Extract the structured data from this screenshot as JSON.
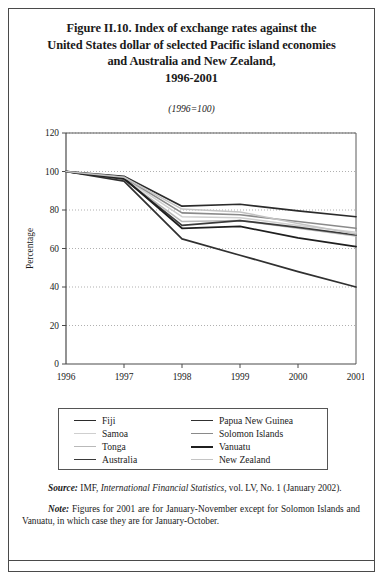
{
  "figure": {
    "title_lines": [
      "Figure II.10.   Index of exchange rates against the",
      "United States dollar of selected Pacific island economies",
      "and Australia and New Zealand,",
      "1996-2001"
    ],
    "subtitle": "(1996=100)"
  },
  "notes": {
    "source_label": "Source:",
    "source_text_1": "IMF,",
    "source_italic": "International Financial Statistics,",
    "source_text_2": "vol. LV, No. 1 (January 2002).",
    "note_label": "Note:",
    "note_text": "Figures for 2001 are for January-November except for Solomon Islands and Vanuatu, in which case they are for January-October."
  },
  "chart_data": {
    "type": "line",
    "title": "Index of exchange rates against the United States dollar of selected Pacific island economies and Australia and New Zealand, 1996-2001",
    "subtitle": "(1996=100)",
    "xlabel": "",
    "ylabel": "Percentage",
    "x": [
      "1996",
      "1997",
      "1998",
      "1999",
      "2000",
      "2001"
    ],
    "xlim": [
      1996,
      2001
    ],
    "ylim": [
      0,
      120
    ],
    "yticks": [
      0,
      20,
      40,
      60,
      80,
      100,
      120
    ],
    "xticks": [
      "1996",
      "1997",
      "1998",
      "1999",
      "2000",
      "2001"
    ],
    "grid": "horizontal-dotted",
    "legend_position": "below-plot",
    "legend_columns": 2,
    "series": [
      {
        "name": "Fiji",
        "color": "#2b2b2b",
        "width": 1.7,
        "values": [
          100,
          97.5,
          82.0,
          83.0,
          79.5,
          76.5
        ]
      },
      {
        "name": "Samoa",
        "color": "#cfcfcf",
        "width": 1.5,
        "values": [
          100,
          96.5,
          76.5,
          76.0,
          72.0,
          68.5
        ]
      },
      {
        "name": "Tonga",
        "color": "#b9b9b9",
        "width": 1.5,
        "values": [
          100,
          96.0,
          74.0,
          74.5,
          70.5,
          66.5
        ]
      },
      {
        "name": "Australia",
        "color": "#3a3a3a",
        "width": 1.7,
        "values": [
          100,
          96.0,
          72.0,
          74.5,
          71.0,
          67.0
        ]
      },
      {
        "name": "Papua New Guinea",
        "color": "#303030",
        "width": 1.7,
        "values": [
          100,
          95.0,
          65.0,
          56.5,
          48.0,
          40.0
        ]
      },
      {
        "name": "Solomon Islands",
        "color": "#8a8a8a",
        "width": 1.6,
        "values": [
          100,
          97.0,
          78.5,
          77.5,
          74.0,
          70.5
        ]
      },
      {
        "name": "Vanuatu",
        "color": "#1f1f1f",
        "width": 1.8,
        "values": [
          100,
          96.5,
          70.5,
          71.5,
          65.5,
          61.0
        ]
      },
      {
        "name": "New Zealand",
        "color": "#c4c4c4",
        "width": 1.5,
        "values": [
          100,
          97.0,
          80.5,
          79.0,
          73.0,
          67.5
        ]
      }
    ]
  }
}
